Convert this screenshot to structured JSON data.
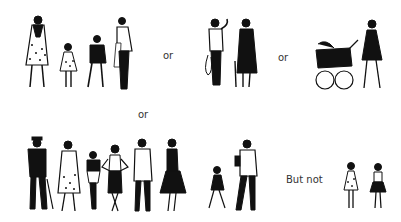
{
  "labels": {
    "or_1": "or",
    "or_2": "or",
    "or_3": "or",
    "but_not": "But not"
  },
  "groups": [
    {
      "name": "family-group",
      "figures": [
        "woman-in-coat",
        "little-girl",
        "boy",
        "man-with-jacket"
      ]
    },
    {
      "name": "elderly-couple",
      "figures": [
        "man-with-bag",
        "woman-with-cane"
      ]
    },
    {
      "name": "mother-with-pram",
      "figures": [
        "woman-pushing-pram"
      ]
    },
    {
      "name": "adult-crowd",
      "figures": [
        "man-in-hat-with-cane",
        "bearded-woman-in-dress",
        "short-man",
        "woman-hands-on-hips",
        "man-in-jacket",
        "woman-in-black-dress"
      ]
    },
    {
      "name": "father-and-child",
      "figures": [
        "walking-girl",
        "man-with-briefcase"
      ]
    },
    {
      "name": "children-alone",
      "figures": [
        "girl-in-dotted-dress",
        "girl-in-skirt"
      ]
    }
  ],
  "colors": {
    "ink": "#111111",
    "paper": "#ffffff",
    "text": "#333333"
  }
}
